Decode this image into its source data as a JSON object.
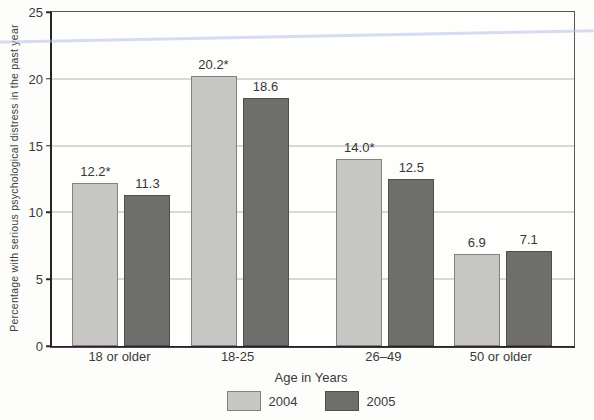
{
  "chart_data": {
    "type": "bar",
    "title": "",
    "categories": [
      "18 or older",
      "18-25",
      "26–49",
      "50 or older"
    ],
    "series": [
      {
        "name": "2004",
        "values": [
          12.2,
          20.2,
          14.0,
          6.9
        ],
        "labels": [
          "12.2*",
          "20.2*",
          "14.0*",
          "6.9"
        ],
        "color": "#c6c7c4",
        "border_color": "#818280"
      },
      {
        "name": "2005",
        "values": [
          11.3,
          18.6,
          12.5,
          7.1
        ],
        "labels": [
          "11.3",
          "18.6",
          "12.5",
          "7.1"
        ],
        "color": "#6e6f6c",
        "border_color": "#4e4f4c"
      }
    ],
    "xlabel": "Age in Years",
    "ylabel": "Percentage with serious psychological distress in the past year",
    "ylim": [
      0,
      25
    ],
    "y_ticks": [
      0,
      5,
      10,
      15,
      20,
      25
    ],
    "grid": "horizontal",
    "legend_position": "bottom"
  }
}
